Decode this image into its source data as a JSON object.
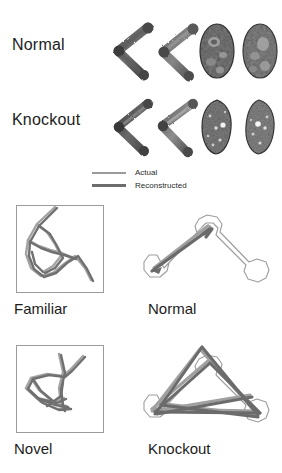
{
  "figure": {
    "background_color": "#ffffff",
    "width": 282,
    "height": 473
  },
  "top_section": {
    "rows": [
      {
        "label": "Normal",
        "maze_photo_1": "chevron-maze-photo",
        "maze_photo_2": "chevron-maze-photo",
        "tissue_photo_1": "oval-tissue-section-photo",
        "tissue_photo_2": "oval-tissue-section-photo"
      },
      {
        "label": "Knockout",
        "maze_photo_1": "chevron-maze-photo",
        "maze_photo_2": "chevron-maze-photo",
        "tissue_photo_1": "oval-tissue-section-photo",
        "tissue_photo_2": "oval-tissue-section-photo"
      }
    ]
  },
  "legend": {
    "entries": [
      {
        "label": "Actual",
        "color": "#9a9a9a",
        "thickness": 2
      },
      {
        "label": "Reconstructed",
        "color": "#6d6d6d",
        "thickness": 3
      }
    ]
  },
  "bottom_section": {
    "panels": [
      {
        "label": "Familiar",
        "kind": "boxed-trace",
        "border_color": "#9b9b9b",
        "trace_color_actual": "#9a9a9a",
        "trace_color_reconstructed": "#6d6d6d"
      },
      {
        "label": "Normal",
        "kind": "v-maze-trajectory",
        "outline_color": "#9b9b9b",
        "trace_color_actual": "#9a9a9a",
        "trace_color_reconstructed": "#6d6d6d"
      },
      {
        "label": "Novel",
        "kind": "boxed-trace",
        "border_color": "#9b9b9b",
        "trace_color_actual": "#9a9a9a",
        "trace_color_reconstructed": "#6d6d6d"
      },
      {
        "label": "Knockout",
        "kind": "v-maze-trajectory",
        "outline_color": "#9b9b9b",
        "trace_color_actual": "#9a9a9a",
        "trace_color_reconstructed": "#6d6d6d"
      }
    ]
  }
}
